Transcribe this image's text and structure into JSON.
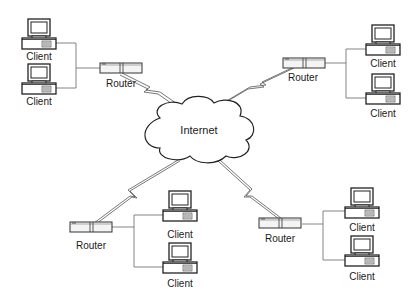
{
  "diagram": {
    "type": "network-topology",
    "colors": {
      "stroke": "#2a2a2a",
      "background": "#ffffff",
      "wan_link": "#555555"
    },
    "cloud": {
      "label": "Internet"
    },
    "sites": [
      {
        "position": "top-left",
        "router": {
          "label": "Router"
        },
        "clients": [
          {
            "label": "Client"
          },
          {
            "label": "Client"
          }
        ]
      },
      {
        "position": "top-right",
        "router": {
          "label": "Router"
        },
        "clients": [
          {
            "label": "Client"
          },
          {
            "label": "Client"
          }
        ]
      },
      {
        "position": "bottom-left",
        "router": {
          "label": "Router"
        },
        "clients": [
          {
            "label": "Client"
          },
          {
            "label": "Client"
          }
        ]
      },
      {
        "position": "bottom-right",
        "router": {
          "label": "Router"
        },
        "clients": [
          {
            "label": "Client"
          },
          {
            "label": "Client"
          }
        ]
      }
    ]
  }
}
